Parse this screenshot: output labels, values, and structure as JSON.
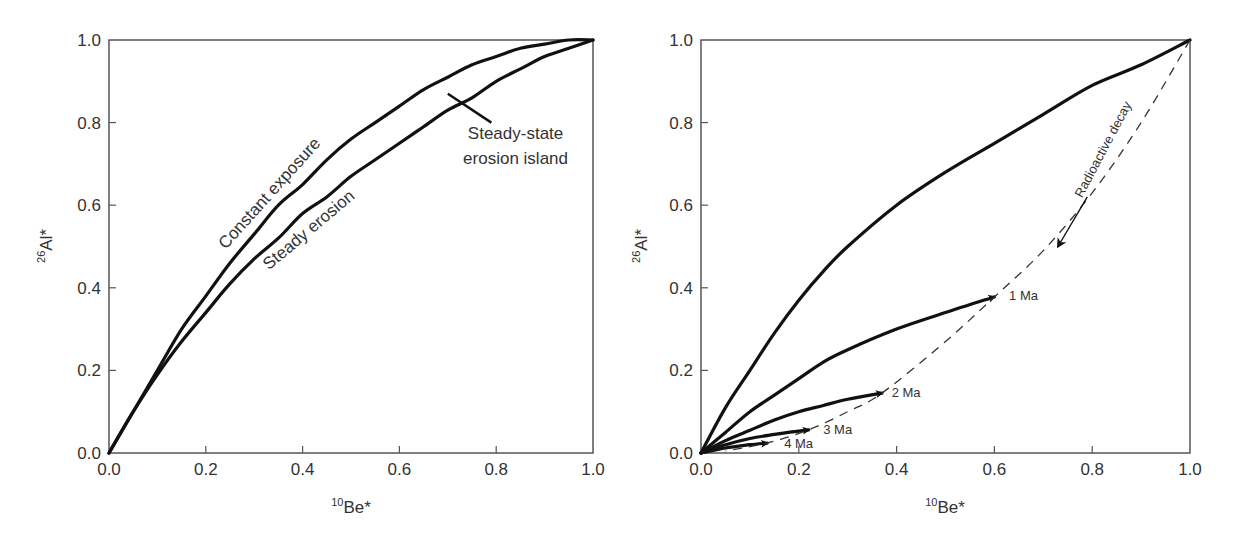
{
  "chart_data": [
    {
      "type": "line",
      "panel": "left",
      "title": "",
      "xlabel": "10Be*",
      "xlabel_sup": "10",
      "xlabel_main": "Be*",
      "ylabel": "26Al*",
      "ylabel_sup": "26",
      "ylabel_main": "Al*",
      "xlim": [
        0,
        1
      ],
      "ylim": [
        0,
        1
      ],
      "xticks": [
        "0.0",
        "0.2",
        "0.4",
        "0.6",
        "0.8",
        "1.0"
      ],
      "yticks": [
        "0.0",
        "0.2",
        "0.4",
        "0.6",
        "0.8",
        "1.0"
      ],
      "grid": false,
      "legend": "none",
      "series": [
        {
          "name": "Constant exposure",
          "style": "solid",
          "x": [
            0,
            0.05,
            0.1,
            0.15,
            0.2,
            0.25,
            0.3,
            0.35,
            0.4,
            0.45,
            0.5,
            0.55,
            0.6,
            0.65,
            0.7,
            0.75,
            0.8,
            0.85,
            0.9,
            0.95,
            1.0
          ],
          "y": [
            0,
            0.1,
            0.2,
            0.3,
            0.38,
            0.46,
            0.53,
            0.6,
            0.65,
            0.71,
            0.76,
            0.8,
            0.84,
            0.88,
            0.91,
            0.94,
            0.96,
            0.98,
            0.99,
            1.0,
            1.0
          ]
        },
        {
          "name": "Steady erosion",
          "style": "solid",
          "x": [
            0,
            0.05,
            0.1,
            0.15,
            0.2,
            0.25,
            0.3,
            0.35,
            0.4,
            0.45,
            0.5,
            0.55,
            0.6,
            0.65,
            0.7,
            0.75,
            0.8,
            0.85,
            0.9,
            0.95,
            1.0
          ],
          "y": [
            0,
            0.1,
            0.19,
            0.27,
            0.34,
            0.41,
            0.47,
            0.52,
            0.58,
            0.62,
            0.67,
            0.71,
            0.75,
            0.79,
            0.83,
            0.86,
            0.9,
            0.93,
            0.96,
            0.98,
            1.0
          ]
        }
      ],
      "annotations": [
        {
          "text": "Constant exposure",
          "x": 0.34,
          "y": 0.62,
          "rotation": -48
        },
        {
          "text": "Steady erosion",
          "x": 0.42,
          "y": 0.53,
          "rotation": -40
        },
        {
          "text": "Steady-state",
          "x": 0.84,
          "y": 0.76
        },
        {
          "text": "erosion island",
          "x": 0.84,
          "y": 0.7
        },
        {
          "pointer": true,
          "x1": 0.7,
          "y1": 0.87,
          "x2": 0.79,
          "y2": 0.8
        }
      ]
    },
    {
      "type": "line",
      "panel": "right",
      "title": "",
      "xlabel": "10Be*",
      "xlabel_sup": "10",
      "xlabel_main": "Be*",
      "ylabel": "26Al*",
      "ylabel_sup": "26",
      "ylabel_main": "Al*",
      "xlim": [
        0,
        1
      ],
      "ylim": [
        0,
        1
      ],
      "xticks": [
        "0.0",
        "0.2",
        "0.4",
        "0.6",
        "0.8",
        "1.0"
      ],
      "yticks": [
        "0.0",
        "0.2",
        "0.4",
        "0.6",
        "0.8",
        "1.0"
      ],
      "grid": false,
      "legend": "none",
      "series": [
        {
          "name": "Steady erosion (0 Ma)",
          "style": "solid",
          "x": [
            0,
            0.05,
            0.1,
            0.15,
            0.2,
            0.25,
            0.3,
            0.4,
            0.5,
            0.6,
            0.7,
            0.8,
            0.9,
            1.0
          ],
          "y": [
            0,
            0.11,
            0.2,
            0.29,
            0.37,
            0.44,
            0.5,
            0.6,
            0.68,
            0.75,
            0.82,
            0.89,
            0.94,
            1.0
          ]
        },
        {
          "name": "1 Ma",
          "style": "solid",
          "x": [
            0,
            0.05,
            0.1,
            0.15,
            0.2,
            0.25,
            0.3,
            0.4,
            0.5,
            0.6
          ],
          "y": [
            0,
            0.05,
            0.1,
            0.14,
            0.18,
            0.22,
            0.25,
            0.3,
            0.34,
            0.378
          ]
        },
        {
          "name": "2 Ma",
          "style": "solid",
          "x": [
            0,
            0.05,
            0.1,
            0.15,
            0.2,
            0.25,
            0.3,
            0.37
          ],
          "y": [
            0,
            0.03,
            0.055,
            0.08,
            0.1,
            0.115,
            0.13,
            0.145
          ]
        },
        {
          "name": "3 Ma",
          "style": "solid",
          "x": [
            0,
            0.05,
            0.1,
            0.15,
            0.22
          ],
          "y": [
            0,
            0.02,
            0.035,
            0.045,
            0.056
          ]
        },
        {
          "name": "4 Ma",
          "style": "solid",
          "x": [
            0,
            0.05,
            0.1,
            0.135
          ],
          "y": [
            0,
            0.012,
            0.02,
            0.024
          ]
        },
        {
          "name": "Radioactive decay path",
          "style": "dashed",
          "x": [
            1.0,
            0.9,
            0.8,
            0.7,
            0.6,
            0.5,
            0.37,
            0.3,
            0.22,
            0.135,
            0.05
          ],
          "y": [
            1.0,
            0.8,
            0.63,
            0.49,
            0.378,
            0.27,
            0.145,
            0.1,
            0.056,
            0.024,
            0.005
          ]
        }
      ],
      "annotations": [
        {
          "text": "1 Ma",
          "x": 0.63,
          "y": 0.37
        },
        {
          "text": "2 Ma",
          "x": 0.39,
          "y": 0.135
        },
        {
          "text": "3 Ma",
          "x": 0.25,
          "y": 0.045
        },
        {
          "text": "4 Ma",
          "x": 0.17,
          "y": 0.012
        },
        {
          "text": "Radioactive decay",
          "x": 0.83,
          "y": 0.73,
          "rotation": -62
        },
        {
          "arrow": true,
          "x1": 0.79,
          "y1": 0.62,
          "x2": 0.73,
          "y2": 0.5
        }
      ]
    }
  ]
}
